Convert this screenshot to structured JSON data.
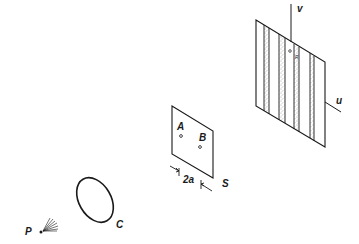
{
  "figure": {
    "type": "two-pinhole interference setup",
    "background": "#ffffff",
    "ink_color": "#1a1a1a",
    "source": {
      "label": "P"
    },
    "lens": {
      "label": "C"
    },
    "aperture_screen": {
      "label": "S",
      "pinholes": [
        {
          "label": "A"
        },
        {
          "label": "B"
        }
      ],
      "separation_label": "2a"
    },
    "observation_screen": {
      "axes": [
        {
          "label": "v"
        },
        {
          "label": "u"
        }
      ],
      "point_labels": [
        "Q",
        "R"
      ],
      "fringe_count_shaded": 4
    }
  }
}
